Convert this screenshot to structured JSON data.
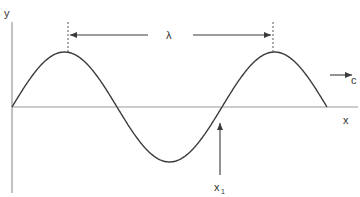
{
  "diagram": {
    "axes": {
      "y_label": "y",
      "x_label": "x"
    },
    "wavelength_label": "λ",
    "velocity_label": "c",
    "point_label": "x",
    "point_label_subscript": "1",
    "wave": {
      "type": "sine",
      "periods": 1.5,
      "start_phase": "zero-crossing rising"
    },
    "colors": {
      "axis": "#9a9a9a",
      "wave": "#3a3a3a",
      "arrow": "#3a3a3a",
      "text": "#333333"
    }
  }
}
